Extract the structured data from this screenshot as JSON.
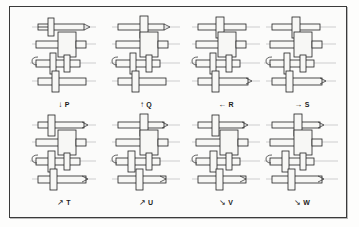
{
  "figure": {
    "border_color": "#3a3a3a",
    "background_color": "#fbfbfa",
    "line_color": "#222222",
    "part_fill_color": "#f7f7f5"
  },
  "panels": [
    {
      "letter": "P",
      "arrow_glyph": "↓",
      "arrow_direction": "down",
      "label_text": "P"
    },
    {
      "letter": "Q",
      "arrow_glyph": "↑",
      "arrow_direction": "up",
      "label_text": "Q"
    },
    {
      "letter": "R",
      "arrow_glyph": "←",
      "arrow_direction": "left",
      "label_text": "R"
    },
    {
      "letter": "S",
      "arrow_glyph": "→",
      "arrow_direction": "right",
      "label_text": "S"
    },
    {
      "letter": "T",
      "arrow_glyph": "↗",
      "arrow_direction": "up-right",
      "label_text": "T"
    },
    {
      "letter": "U",
      "arrow_glyph": "↗",
      "arrow_direction": "up-right",
      "label_text": "U"
    },
    {
      "letter": "V",
      "arrow_glyph": "↘",
      "arrow_direction": "down-right",
      "label_text": "V"
    },
    {
      "letter": "W",
      "arrow_glyph": "↘",
      "arrow_direction": "down-right",
      "label_text": "W"
    }
  ],
  "assembly": {
    "shaft_count": 4,
    "description": "Mechanical shaft and collar assembly, orthographic line drawing"
  }
}
